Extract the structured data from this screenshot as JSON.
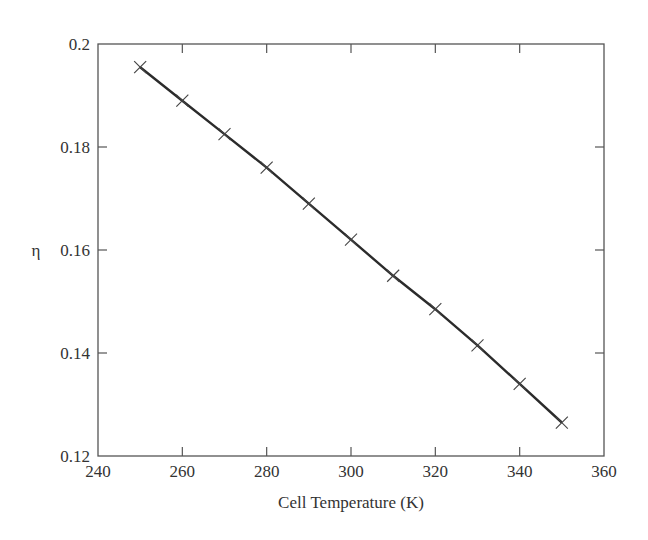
{
  "chart_data": {
    "type": "line",
    "title": "",
    "xlabel": "Cell Temperature (K)",
    "ylabel": "η",
    "xlim": [
      240,
      360
    ],
    "ylim": [
      0.12,
      0.2
    ],
    "xticks": [
      "240",
      "260",
      "280",
      "300",
      "320",
      "340",
      "360"
    ],
    "yticks": [
      "0.12",
      "0.14",
      "0.16",
      "0.18",
      "0.2"
    ],
    "grid": false,
    "legend": null,
    "marker": "x",
    "series": [
      {
        "name": "efficiency",
        "x": [
          250,
          260,
          270,
          280,
          290,
          300,
          310,
          320,
          330,
          340,
          350
        ],
        "values": [
          0.1955,
          0.189,
          0.1825,
          0.176,
          0.169,
          0.162,
          0.155,
          0.1485,
          0.1415,
          0.134,
          0.1265
        ]
      }
    ]
  },
  "colors": {
    "line": "#2b2b2b",
    "axis": "#555555",
    "text": "#333333"
  }
}
